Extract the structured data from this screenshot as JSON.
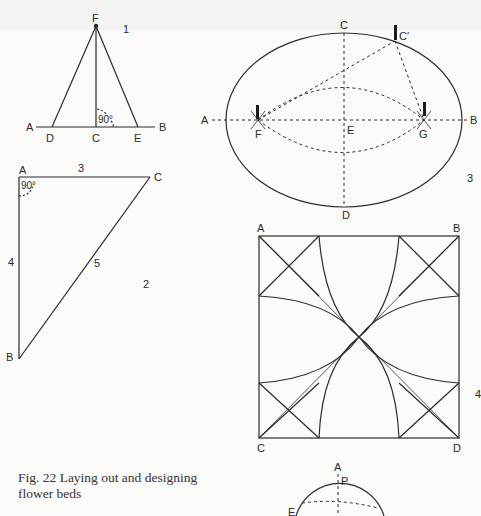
{
  "figure": {
    "caption": "Fig. 22   Laying out and designing flower beds",
    "caption_line1": "Fig. 22   Laying out and designing",
    "caption_line2": "flower beds"
  },
  "diagram1": {
    "number": "1",
    "labels": {
      "F": "F",
      "A": "A",
      "D": "D",
      "C": "C",
      "E": "E",
      "B": "B"
    },
    "angle": "90°"
  },
  "diagram2": {
    "number": "2",
    "labels": {
      "A": "A",
      "B": "B",
      "C": "C"
    },
    "sides": {
      "AC": "3",
      "AB": "4",
      "BC": "5"
    },
    "angle": "90°"
  },
  "diagram3": {
    "number": "3",
    "labels": {
      "A": "A",
      "B": "B",
      "C": "C",
      "C_prime": "C′",
      "D": "D",
      "E": "E",
      "F": "F",
      "G": "G"
    }
  },
  "diagram4": {
    "number": "4",
    "labels": {
      "A": "A",
      "B": "B",
      "C": "C",
      "D": "D"
    }
  },
  "diagram5": {
    "labels": {
      "A": "A",
      "P": "P",
      "E": "E"
    }
  },
  "colors": {
    "line": "#2a2a2a",
    "background": "#fbfbfa"
  }
}
